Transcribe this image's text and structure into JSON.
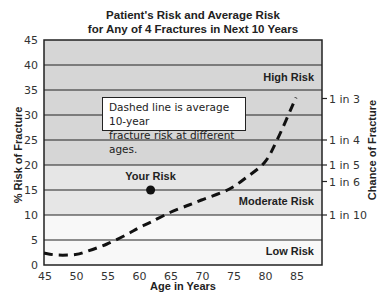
{
  "title_line1": "Patient's Risk and Average Risk",
  "title_line2": "for Any of 4 Fractures in Next 10 Years",
  "note_line1": "Dashed line is average 10-year",
  "note_line2": "fracture risk at different ages.",
  "colors": {
    "high_band": "#d6d6d6",
    "moderate_band": "#e6e6e6",
    "low_band": "#f8f8f8",
    "grid": "#222222",
    "curve": "#111111"
  },
  "chart_data": {
    "type": "line",
    "xlabel": "Age in Years",
    "ylabel": "% Risk of Fracture",
    "y2label": "Chance of Fracture",
    "xlim": [
      45,
      89
    ],
    "ylim": [
      0,
      45
    ],
    "xticks": [
      45,
      50,
      55,
      60,
      65,
      70,
      75,
      80,
      85
    ],
    "yticks": [
      0,
      5,
      10,
      15,
      20,
      25,
      30,
      35,
      40,
      45
    ],
    "grid": true,
    "y2ticks": [
      {
        "value": 33.3,
        "label": "1 in 3"
      },
      {
        "value": 25,
        "label": "1 in 4"
      },
      {
        "value": 20,
        "label": "1 in 5"
      },
      {
        "value": 16.7,
        "label": "1 in 6"
      },
      {
        "value": 10,
        "label": "1 in 10"
      }
    ],
    "bands": [
      {
        "label": "Low Risk",
        "from": 0,
        "to": 10
      },
      {
        "label": "Moderate Risk",
        "from": 10,
        "to": 20
      },
      {
        "label": "High Risk",
        "from": 20,
        "to": 45
      }
    ],
    "series": [
      {
        "name": "Average 10-year fracture risk",
        "style": "dashed",
        "x": [
          45,
          47,
          50,
          52,
          55,
          58,
          60,
          62,
          65,
          68,
          70,
          73,
          75,
          77,
          80,
          82,
          85
        ],
        "y": [
          2.4,
          2.0,
          2.1,
          2.8,
          4.2,
          6.0,
          7.4,
          8.6,
          10.5,
          12.0,
          13.0,
          14.4,
          15.6,
          17.4,
          20.5,
          25.0,
          33.5
        ]
      }
    ],
    "annotations": [
      {
        "label": "Your Risk",
        "x": 62,
        "y": 15,
        "marker": "filled-circle"
      },
      {
        "label": "Dashed line is average 10-year fracture risk at different ages.",
        "type": "textbox"
      }
    ]
  }
}
